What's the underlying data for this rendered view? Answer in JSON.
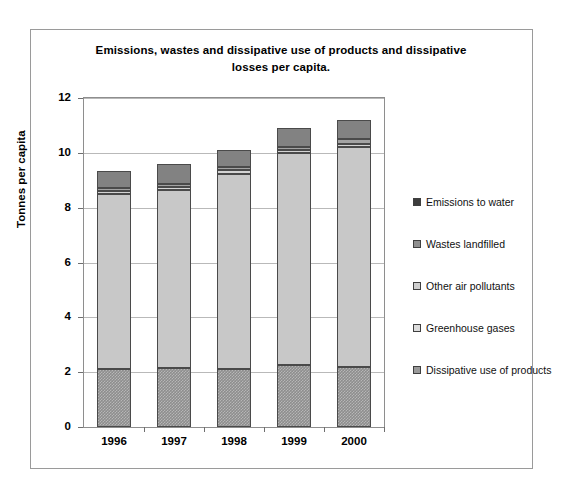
{
  "chart_data": {
    "type": "bar",
    "subtype": "stacked-vertical",
    "title": "Emissions, wastes and dissipative use of products and dissipative losses per capita.",
    "title_line1": "Emissions, wastes and dissipative use of products and dissipative",
    "title_line2": "losses per capita.",
    "xlabel": "",
    "ylabel": "Tonnes per capita",
    "ylim": [
      0,
      12
    ],
    "yticks": [
      0,
      2,
      4,
      6,
      8,
      10,
      12
    ],
    "ytick_labels": [
      "0",
      "2",
      "4",
      "6",
      "8",
      "10",
      "12"
    ],
    "grid": true,
    "legend_position": "right",
    "categories": [
      "1996",
      "1997",
      "1998",
      "1999",
      "2000"
    ],
    "stack_order_bottom_to_top": [
      "Dissipative use of products",
      "Greenhouse gases",
      "Other air pollutants",
      "Wastes landfilled",
      "Emissions to water"
    ],
    "series": [
      {
        "name": "Dissipative use of products",
        "key": "dissipative",
        "color": "#8d8d8d",
        "values": [
          2.12,
          2.15,
          2.12,
          2.25,
          2.18
        ]
      },
      {
        "name": "Greenhouse gases",
        "key": "greenhouse",
        "color": "#c8c8c8",
        "values": [
          6.38,
          6.5,
          7.1,
          7.75,
          8.02
        ]
      },
      {
        "name": "Other air pollutants",
        "key": "otherair",
        "color": "#d4d4d4",
        "values": [
          0.12,
          0.12,
          0.15,
          0.1,
          0.12
        ]
      },
      {
        "name": "Wastes landfilled",
        "key": "wastes",
        "color": "#a3a3a3",
        "values": [
          0.08,
          0.08,
          0.1,
          0.12,
          0.18
        ]
      },
      {
        "name": "Emissions to water",
        "key": "water",
        "color": "#828282",
        "values": [
          0.65,
          0.75,
          0.63,
          0.68,
          0.7
        ]
      }
    ],
    "totals": [
      9.35,
      9.6,
      10.1,
      10.9,
      11.2
    ]
  },
  "legend": {
    "items": [
      {
        "label": "Emissions to water",
        "swatch_class": "sw-water"
      },
      {
        "label": "Wastes landfilled",
        "swatch_class": "sw-wastes"
      },
      {
        "label": "Other air pollutants",
        "swatch_class": "sw-otherair"
      },
      {
        "label": "Greenhouse gases",
        "swatch_class": "sw-greenhouse"
      },
      {
        "label": "Dissipative use of products",
        "swatch_class": "sw-dissipative"
      }
    ]
  }
}
